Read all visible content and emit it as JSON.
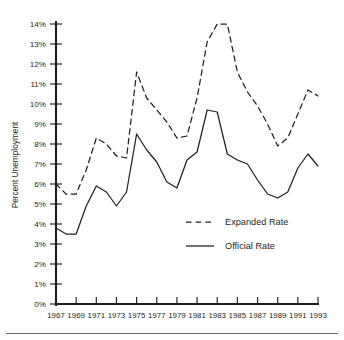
{
  "chart_data": {
    "type": "line",
    "title": "",
    "xlabel": "",
    "ylabel": "Percent Unemployment",
    "xlim": [
      1967,
      1993
    ],
    "ylim": [
      0,
      14
    ],
    "grid": false,
    "legend_position": "center-right-inside",
    "x": [
      1967,
      1968,
      1969,
      1970,
      1971,
      1972,
      1973,
      1974,
      1975,
      1976,
      1977,
      1978,
      1979,
      1980,
      1981,
      1982,
      1983,
      1984,
      1985,
      1986,
      1987,
      1988,
      1989,
      1990,
      1991,
      1992,
      1993
    ],
    "xtick_labels": [
      "1967",
      "1969",
      "1971",
      "1973",
      "1975",
      "1977",
      "1979",
      "1981",
      "1983",
      "1985",
      "1987",
      "1989",
      "1991",
      "1993"
    ],
    "xtick_values": [
      1967,
      1969,
      1971,
      1973,
      1975,
      1977,
      1979,
      1981,
      1983,
      1985,
      1987,
      1989,
      1991,
      1993
    ],
    "ytick_labels": [
      "0%",
      "1%",
      "2%",
      "3%",
      "4%",
      "5%",
      "6%",
      "7%",
      "8%",
      "9%",
      "10%",
      "11%",
      "12%",
      "13%",
      "14%"
    ],
    "ytick_values": [
      0,
      1,
      2,
      3,
      4,
      5,
      6,
      7,
      8,
      9,
      10,
      11,
      12,
      13,
      14
    ],
    "series": [
      {
        "name": "Expanded Rate",
        "style": "dashed",
        "color": "#231f20",
        "values": [
          6.0,
          5.5,
          5.5,
          6.7,
          8.3,
          8.0,
          7.4,
          7.3,
          11.6,
          10.3,
          9.7,
          9.1,
          8.3,
          8.4,
          10.3,
          13.1,
          14.0,
          14.0,
          11.6,
          10.6,
          9.9,
          9.0,
          7.9,
          8.3,
          9.5,
          10.7,
          10.4
        ]
      },
      {
        "name": "Official Rate",
        "style": "solid",
        "color": "#231f20",
        "values": [
          3.8,
          3.5,
          3.5,
          4.9,
          5.9,
          5.6,
          4.9,
          5.6,
          8.5,
          7.7,
          7.1,
          6.1,
          5.8,
          7.2,
          7.6,
          9.7,
          9.6,
          7.5,
          7.2,
          7.0,
          6.2,
          5.5,
          5.3,
          5.6,
          6.8,
          7.5,
          6.9
        ]
      }
    ],
    "annotations": []
  },
  "legend": {
    "entries": [
      {
        "label": "Expanded Rate",
        "style": "dashed"
      },
      {
        "label": "Official Rate",
        "style": "solid"
      }
    ]
  },
  "axes": {
    "y_title": "Percent Unemployment"
  }
}
